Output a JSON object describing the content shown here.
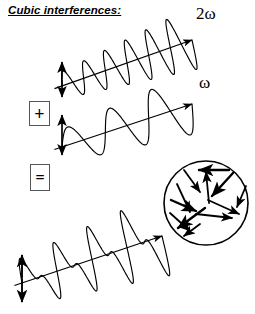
{
  "figure": {
    "title": "Cubic interferences:",
    "width": 255,
    "height": 314,
    "background": "#ffffff",
    "ink_color": "#000000"
  },
  "operators": {
    "plus": "+",
    "equals": "="
  },
  "labels": {
    "second_harmonic": "2ω",
    "fundamental": "ω"
  },
  "chart_data": {
    "type": "line",
    "title": "Cubic interferences:",
    "grid": false,
    "legend": false,
    "panels": [
      {
        "name": "second-harmonic-wave",
        "label": "2ω",
        "cycles": 6,
        "axis": {
          "x0": 62,
          "y0": 86,
          "x1": 192,
          "y1": 40
        },
        "amplitude_start": 13,
        "amplitude_end": 30,
        "amplitude_marker": {
          "x": 62,
          "y_top": 62,
          "y_bottom": 97
        }
      },
      {
        "name": "fundamental-wave",
        "label": "ω",
        "cycles": 3,
        "axis": {
          "x0": 62,
          "y0": 147,
          "x1": 192,
          "y1": 104
        },
        "amplitude_start": 16,
        "amplitude_end": 30,
        "amplitude_marker": {
          "x": 62,
          "y_top": 115,
          "y_bottom": 155
        }
      },
      {
        "name": "sum-wave",
        "label": "",
        "cycles": 4,
        "axis": {
          "x0": 22,
          "y0": 283,
          "x1": 162,
          "y1": 236
        },
        "amplitude_start": 24,
        "amplitude_end": 42,
        "amplitude_marker": {
          "x": 22,
          "y_top": 255,
          "y_bottom": 302
        }
      }
    ],
    "random_orientation_circle": {
      "name": "random-arrow-circle",
      "center_x": 206,
      "center_y": 203,
      "radius": 42,
      "arrow_count": 12,
      "arrows": [
        {
          "x1": 229,
          "y1": 170,
          "x2": 199,
          "y2": 170,
          "head": "end"
        },
        {
          "x1": 184,
          "y1": 170,
          "x2": 200,
          "y2": 192,
          "head": "end"
        },
        {
          "x1": 209,
          "y1": 203,
          "x2": 206,
          "y2": 172,
          "head": "end"
        },
        {
          "x1": 233,
          "y1": 173,
          "x2": 212,
          "y2": 196,
          "head": "end"
        },
        {
          "x1": 246,
          "y1": 186,
          "x2": 237,
          "y2": 207,
          "head": "end"
        },
        {
          "x1": 177,
          "y1": 184,
          "x2": 190,
          "y2": 212,
          "head": "end"
        },
        {
          "x1": 171,
          "y1": 200,
          "x2": 196,
          "y2": 211,
          "head": "end"
        },
        {
          "x1": 208,
          "y1": 200,
          "x2": 239,
          "y2": 214,
          "head": "end"
        },
        {
          "x1": 196,
          "y1": 214,
          "x2": 232,
          "y2": 218,
          "head": "end"
        },
        {
          "x1": 205,
          "y1": 208,
          "x2": 178,
          "y2": 228,
          "head": "end"
        },
        {
          "x1": 200,
          "y1": 224,
          "x2": 184,
          "y2": 236,
          "head": "end"
        },
        {
          "x1": 170,
          "y1": 213,
          "x2": 190,
          "y2": 231,
          "head": "end"
        }
      ]
    }
  }
}
